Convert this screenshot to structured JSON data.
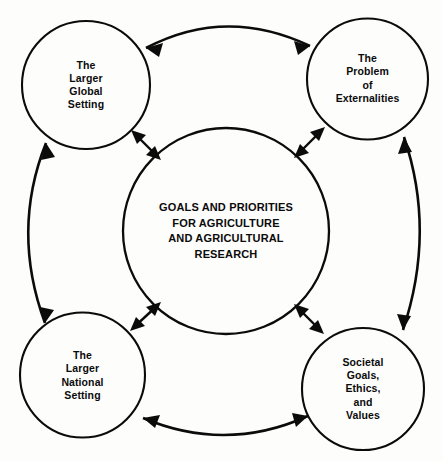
{
  "diagram": {
    "title": "Goals and Priorities for Agriculture and Agricultural Research",
    "stroke_color": "#0b0b0b",
    "background_color": "#fdfdfb",
    "text_color": "#0b0b0b",
    "center": {
      "id": "center-goals",
      "lines": [
        "GOALS AND PRIORITIES",
        "FOR AGRICULTURE",
        "AND AGRICULTURAL",
        "RESEARCH"
      ]
    },
    "nodes": [
      {
        "id": "global-setting",
        "position": "top-left",
        "lines": [
          "The",
          "Larger",
          "Global",
          "Setting"
        ]
      },
      {
        "id": "externalities",
        "position": "top-right",
        "lines": [
          "The",
          "Problem",
          "of",
          "Externalities"
        ]
      },
      {
        "id": "national-setting",
        "position": "bottom-left",
        "lines": [
          "The",
          "Larger",
          "National",
          "Setting"
        ]
      },
      {
        "id": "societal-goals",
        "position": "bottom-right",
        "lines": [
          "Societal",
          "Goals,",
          "Ethics,",
          "and",
          "Values"
        ]
      }
    ],
    "connectors": [
      {
        "id": "top-arc",
        "from": "global-setting",
        "to": "externalities",
        "style": "curved",
        "heads": "double"
      },
      {
        "id": "left-arc",
        "from": "global-setting",
        "to": "national-setting",
        "style": "curved",
        "heads": "double"
      },
      {
        "id": "right-arc",
        "from": "externalities",
        "to": "societal-goals",
        "style": "curved",
        "heads": "double"
      },
      {
        "id": "bottom-arc",
        "from": "national-setting",
        "to": "societal-goals",
        "style": "curved",
        "heads": "double"
      },
      {
        "id": "spoke-top-left",
        "from": "global-setting",
        "to": "center-goals",
        "style": "straight",
        "heads": "double"
      },
      {
        "id": "spoke-top-right",
        "from": "externalities",
        "to": "center-goals",
        "style": "straight",
        "heads": "double"
      },
      {
        "id": "spoke-bottom-left",
        "from": "national-setting",
        "to": "center-goals",
        "style": "straight",
        "heads": "double"
      },
      {
        "id": "spoke-bottom-right",
        "from": "societal-goals",
        "to": "center-goals",
        "style": "straight",
        "heads": "double"
      }
    ]
  }
}
